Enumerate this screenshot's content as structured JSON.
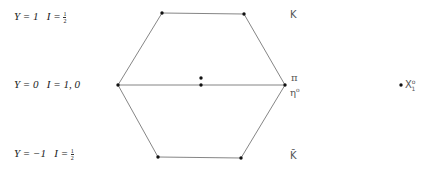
{
  "rows": [
    {
      "y_label": "Y = 1",
      "i_label": "I = ",
      "i_frac": {
        "num": "1",
        "den": "2"
      }
    },
    {
      "y_label": "Y = 0",
      "i_label": "I = 1, 0",
      "i_frac": null
    },
    {
      "y_label": "Y = −1",
      "i_label": "I = ",
      "i_frac": {
        "num": "1",
        "den": "2"
      }
    }
  ],
  "particles": {
    "top": "K",
    "middle_top": "π",
    "middle_bottom": "η",
    "middle_bottom_sup": "o",
    "bottom": "K̄",
    "singlet": "X",
    "singlet_sup": "o",
    "singlet_sub": "1"
  },
  "hexagon": {
    "vertices": [
      [
        162,
        13
      ],
      [
        244,
        14
      ],
      [
        285,
        85
      ],
      [
        241,
        158
      ],
      [
        158,
        157
      ],
      [
        118,
        85
      ]
    ],
    "center_points": [
      [
        201,
        78
      ],
      [
        201,
        85
      ]
    ],
    "line_color": "#777777",
    "dot_color": "#111111"
  }
}
